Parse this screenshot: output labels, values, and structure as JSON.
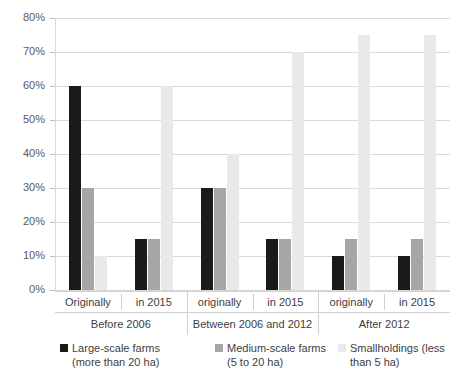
{
  "chart_data": {
    "type": "bar",
    "title": "",
    "subtitle": "",
    "xlabel": "",
    "ylabel": "",
    "ylim": [
      0,
      80
    ],
    "ytick_labels": [
      "0%",
      "10%",
      "20%",
      "30%",
      "40%",
      "50%",
      "60%",
      "70%",
      "80%"
    ],
    "ytick_values": [
      0,
      10,
      20,
      30,
      40,
      50,
      60,
      70,
      80
    ],
    "grid": true,
    "legend_position": "bottom",
    "value_unit": "%",
    "categories": [
      "Originally",
      "in 2015",
      "originally",
      "in 2015",
      "originally",
      "in 2015"
    ],
    "group_labels": [
      "Before 2006",
      "Between 2006 and 2012",
      "After 2012"
    ],
    "groups": [
      {
        "label": "Before 2006",
        "clusters": [
          {
            "label": "Originally",
            "large": 60,
            "medium": 30,
            "small": 10
          },
          {
            "label": "in 2015",
            "large": 15,
            "medium": 15,
            "small": 60
          }
        ]
      },
      {
        "label": "Between 2006 and 2012",
        "clusters": [
          {
            "label": "originally",
            "large": 30,
            "medium": 30,
            "small": 40
          },
          {
            "label": "in 2015",
            "large": 15,
            "medium": 15,
            "small": 70
          }
        ]
      },
      {
        "label": "After 2012",
        "clusters": [
          {
            "label": "originally",
            "large": 10,
            "medium": 15,
            "small": 75
          },
          {
            "label": "in 2015",
            "large": 10,
            "medium": 15,
            "small": 75
          }
        ]
      }
    ],
    "series": [
      {
        "name": "Large-scale farms (more than 20 ha)",
        "legend_line1": "Large-scale farms",
        "legend_line2": "(more than 20 ha)",
        "color": "#1a1a1a",
        "values": [
          60,
          15,
          30,
          15,
          10,
          10
        ]
      },
      {
        "name": "Medium-scale farms (5 to 20 ha)",
        "legend_line1": "Medium-scale farms",
        "legend_line2": "(5 to 20 ha)",
        "color": "#a6a6a6",
        "values": [
          30,
          15,
          30,
          15,
          15,
          15
        ]
      },
      {
        "name": "Smallholdings (less than 5 ha)",
        "legend_line1": "Smallholdings (less",
        "legend_line2": "than 5 ha)",
        "color": "#e9e9e9",
        "values": [
          10,
          60,
          40,
          70,
          75,
          75
        ]
      }
    ]
  },
  "axis": {
    "ticks": [
      {
        "label": "80%"
      },
      {
        "label": "70%"
      },
      {
        "label": "60%"
      },
      {
        "label": "50%"
      },
      {
        "label": "40%"
      },
      {
        "label": "30%"
      },
      {
        "label": "20%"
      },
      {
        "label": "10%"
      },
      {
        "label": "0%"
      }
    ]
  },
  "legend": {
    "items": [
      {
        "line1": "Large-scale farms",
        "line2": "(more than 20 ha)",
        "swatch": "large-scale-swatch"
      },
      {
        "line1": "Medium-scale farms",
        "line2": "(5 to 20 ha)",
        "swatch": "medium-scale-swatch"
      },
      {
        "line1": "Smallholdings (less",
        "line2": "than 5 ha)",
        "swatch": "smallholdings-swatch"
      }
    ]
  }
}
